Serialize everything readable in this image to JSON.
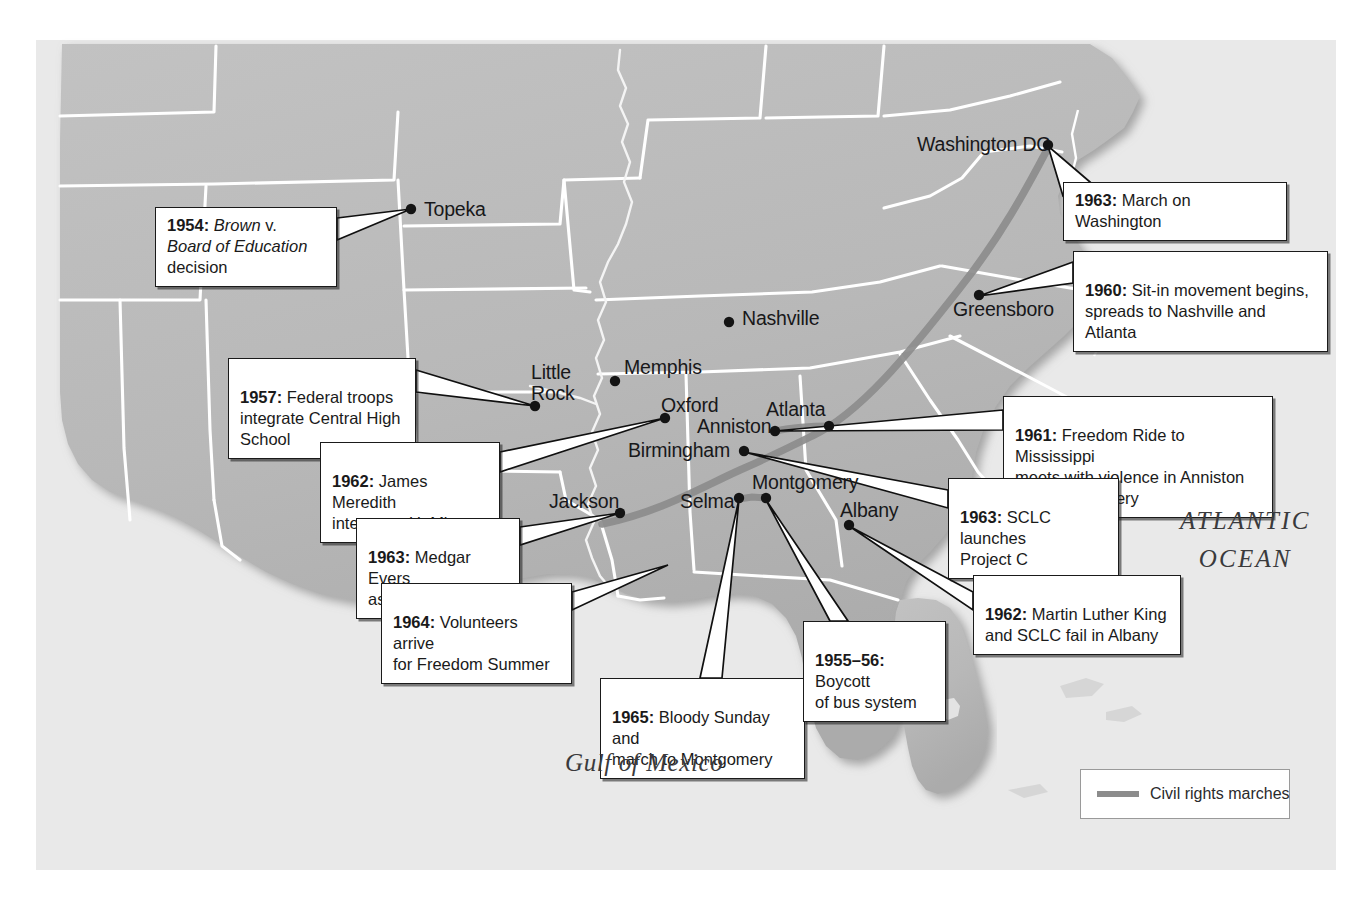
{
  "map": {
    "title": "Civil Rights Movement events map, southeastern United States",
    "colors": {
      "land": "#b9b9b9",
      "ocean": "#e9e9e9",
      "border": "#ffffff",
      "march_route": "#8c8c8c",
      "callout_text": "#1a1a1a",
      "city_dot": "#141414"
    },
    "cities": [
      {
        "name": "Topeka",
        "label": "Topeka",
        "x": 411,
        "y": 209,
        "label_x": 424,
        "label_y": 199
      },
      {
        "name": "Washington DC",
        "label": "Washington DC",
        "x": 1048,
        "y": 145,
        "label_x": 917,
        "label_y": 134
      },
      {
        "name": "Greensboro",
        "label": "Greensboro",
        "x": 979,
        "y": 295,
        "label_x": 953,
        "label_y": 299
      },
      {
        "name": "Nashville",
        "label": "Nashville",
        "x": 729,
        "y": 322,
        "label_x": 742,
        "label_y": 308
      },
      {
        "name": "Little Rock",
        "label": "Little\nRock",
        "x": 535,
        "y": 406,
        "label_x": 531,
        "label_y": 364
      },
      {
        "name": "Memphis",
        "label": "Memphis",
        "x": 615,
        "y": 381,
        "label_x": 624,
        "label_y": 357
      },
      {
        "name": "Oxford",
        "label": "Oxford",
        "x": 665,
        "y": 418,
        "label_x": 661,
        "label_y": 396
      },
      {
        "name": "Atlanta",
        "label": "Atlanta",
        "x": 829,
        "y": 426,
        "label_x": 766,
        "label_y": 400
      },
      {
        "name": "Anniston",
        "label": "Anniston",
        "x": 775,
        "y": 431,
        "label_x": 697,
        "label_y": 418
      },
      {
        "name": "Birmingham",
        "label": "Birmingham",
        "x": 744,
        "y": 451,
        "label_x": 628,
        "label_y": 441
      },
      {
        "name": "Jackson",
        "label": "Jackson",
        "x": 620,
        "y": 513,
        "label_x": 549,
        "label_y": 493
      },
      {
        "name": "Selma",
        "label": "Selma",
        "x": 739,
        "y": 498,
        "label_x": 680,
        "label_y": 492
      },
      {
        "name": "Montgomery",
        "label": "Montgomery",
        "x": 766,
        "y": 498,
        "label_x": 752,
        "label_y": 474
      },
      {
        "name": "Albany",
        "label": "Albany",
        "x": 849,
        "y": 525,
        "label_x": 840,
        "label_y": 501
      }
    ],
    "callouts": [
      {
        "id": "brown-v-board",
        "year": "1954:",
        "text_runs": [
          {
            "text": " ",
            "style": "normal"
          },
          {
            "text": "Brown v. Board",
            "style": "italic-mixed"
          },
          {
            "text": "\nof Education",
            "style": "italic"
          },
          {
            "text": " decision",
            "style": "normal"
          }
        ],
        "plain": "1954: Brown v. Board of Education decision",
        "x": 155,
        "y": 207,
        "w": 182,
        "h": 52,
        "anchor_x": 411,
        "anchor_y": 209
      },
      {
        "id": "march-on-washington",
        "year": "1963:",
        "plain": "1963: March on Washington",
        "body": " March on Washington",
        "x": 1063,
        "y": 182,
        "w": 224,
        "h": 32,
        "anchor_x": 1048,
        "anchor_y": 146
      },
      {
        "id": "sit-in-movement",
        "year": "1960:",
        "plain": "1960: Sit-in movement begins, spreads to Nashville and Atlanta",
        "body": " Sit-in movement begins,\nspreads to Nashville and Atlanta",
        "x": 1073,
        "y": 251,
        "w": 255,
        "h": 52,
        "anchor_x": 979,
        "anchor_y": 296
      },
      {
        "id": "central-high-school",
        "year": "1957:",
        "plain": "1957: Federal troops integrate Central High School",
        "body": " Federal troops\nintegrate Central High\nSchool",
        "x": 228,
        "y": 358,
        "w": 188,
        "h": 72,
        "anchor_x": 535,
        "anchor_y": 406
      },
      {
        "id": "james-meredith",
        "year": "1962:",
        "plain": "1962: James Meredith integrates U. Miss.",
        "body": " James Meredith\nintegrates U. Miss.",
        "x": 320,
        "y": 442,
        "w": 180,
        "h": 53,
        "anchor_x": 665,
        "anchor_y": 418
      },
      {
        "id": "medgar-evers",
        "year": "1963:",
        "plain": "1963: Medgar Evers assassinated",
        "body": " Medgar Evers\nassassinated",
        "x": 356,
        "y": 518,
        "w": 164,
        "h": 53,
        "anchor_x": 620,
        "anchor_y": 513
      },
      {
        "id": "freedom-summer",
        "year": "1964:",
        "plain": "1964: Volunteers arrive for Freedom Summer",
        "body": " Volunteers arrive\nfor Freedom Summer",
        "x": 381,
        "y": 583,
        "w": 191,
        "h": 53,
        "anchor_x": 668,
        "anchor_y": 565
      },
      {
        "id": "bloody-sunday",
        "year": "1965:",
        "plain": "1965: Bloody Sunday and march to Montgomery",
        "body": " Bloody Sunday and\nmarch to Montgomery",
        "x": 600,
        "y": 678,
        "w": 205,
        "h": 53,
        "anchor_x": 739,
        "anchor_y": 499
      },
      {
        "id": "bus-boycott",
        "year": "1955–56:",
        "plain": "1955–56: Boycott of bus system",
        "body": " Boycott\nof bus system",
        "x": 803,
        "y": 621,
        "w": 143,
        "h": 53,
        "anchor_x": 766,
        "anchor_y": 500
      },
      {
        "id": "freedom-ride",
        "year": "1961:",
        "plain": "1961: Freedom Ride to Mississippi meets with violence in Anniston and Montgomery",
        "body": " Freedom Ride to Mississippi\nmeets with violence in Anniston\nand Montgomery",
        "x": 1003,
        "y": 396,
        "w": 270,
        "h": 73,
        "anchor_x": 775,
        "anchor_y": 431
      },
      {
        "id": "project-c",
        "year": "1963:",
        "plain": "1963: SCLC launches Project C",
        "body": " SCLC launches\nProject C",
        "x": 948,
        "y": 478,
        "w": 171,
        "h": 53,
        "anchor_x": 744,
        "anchor_y": 452
      },
      {
        "id": "albany-movement",
        "year": "1962:",
        "plain": "1962: Martin Luther King and SCLC fail in Albany",
        "body": " Martin Luther King\nand SCLC fail in Albany",
        "x": 973,
        "y": 575,
        "w": 208,
        "h": 53,
        "anchor_x": 849,
        "anchor_y": 526
      }
    ],
    "water_labels": [
      {
        "id": "gulf-of-mexico",
        "text": "Gulf of Mexico",
        "x": 565,
        "y": 749
      },
      {
        "id": "atlantic-ocean",
        "text": "ATLANTIC\nOCEAN",
        "x": 1180,
        "y": 502
      }
    ],
    "legend": {
      "label": "Civil rights marches",
      "x": 1080,
      "y": 769,
      "w": 210,
      "h": 50,
      "swatch_color": "#8c8c8c"
    }
  }
}
